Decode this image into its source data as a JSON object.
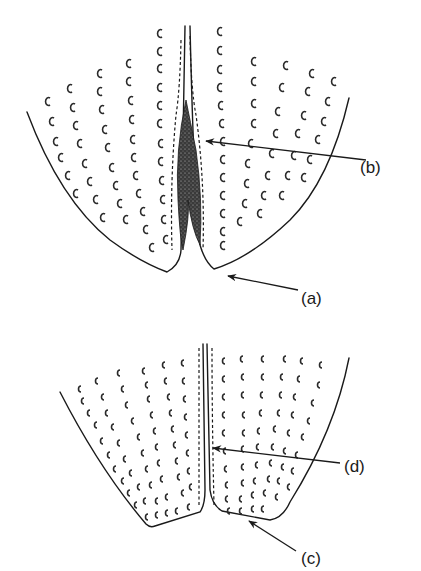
{
  "figure": {
    "background": "#ffffff",
    "ink": "#1a1a1a",
    "panels": [
      {
        "id": "top",
        "description": "Two tissue lobes meeting at a central dark stippled core, flanked by dashed boundary lines",
        "labels": [
          {
            "text": "(b)",
            "x": 360,
            "y": 173,
            "arrow_from": [
              366,
              160
            ],
            "arrow_to": [
              204,
              141
            ]
          },
          {
            "text": "(a)",
            "x": 301,
            "y": 303,
            "arrow_from": [
              300,
              290
            ],
            "arrow_to": [
              226,
              275
            ]
          }
        ]
      },
      {
        "id": "bottom",
        "description": "Two tissue lobes separated by a narrow double-dashed central channel",
        "labels": [
          {
            "text": "(d)",
            "x": 344,
            "y": 471,
            "arrow_from": [
              340,
              463
            ],
            "arrow_to": [
              211,
              448
            ]
          },
          {
            "text": "(c)",
            "x": 301,
            "y": 564,
            "arrow_from": [
              296,
              552
            ],
            "arrow_to": [
              247,
              520
            ]
          }
        ]
      }
    ]
  }
}
